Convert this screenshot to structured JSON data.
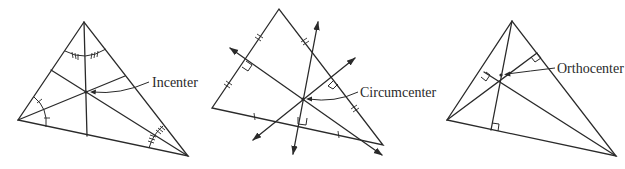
{
  "figure": {
    "panels": [
      {
        "id": "incenter",
        "label": "Incenter",
        "description": "Triangle with three angle bisectors meeting at the incenter; angles marked with congruent arcs and tick marks"
      },
      {
        "id": "circumcenter",
        "label": "Circumcenter",
        "description": "Triangle with three perpendicular bisectors (drawn as arrows) meeting at the circumcenter; side midpoints marked with tick marks and right-angle boxes"
      },
      {
        "id": "orthocenter",
        "label": "Orthocenter",
        "description": "Triangle with three altitudes meeting at the orthocenter; right-angle boxes at the feet of the altitudes"
      }
    ]
  },
  "colors": {
    "stroke": "#2a2a2a",
    "background": "#ffffff"
  }
}
